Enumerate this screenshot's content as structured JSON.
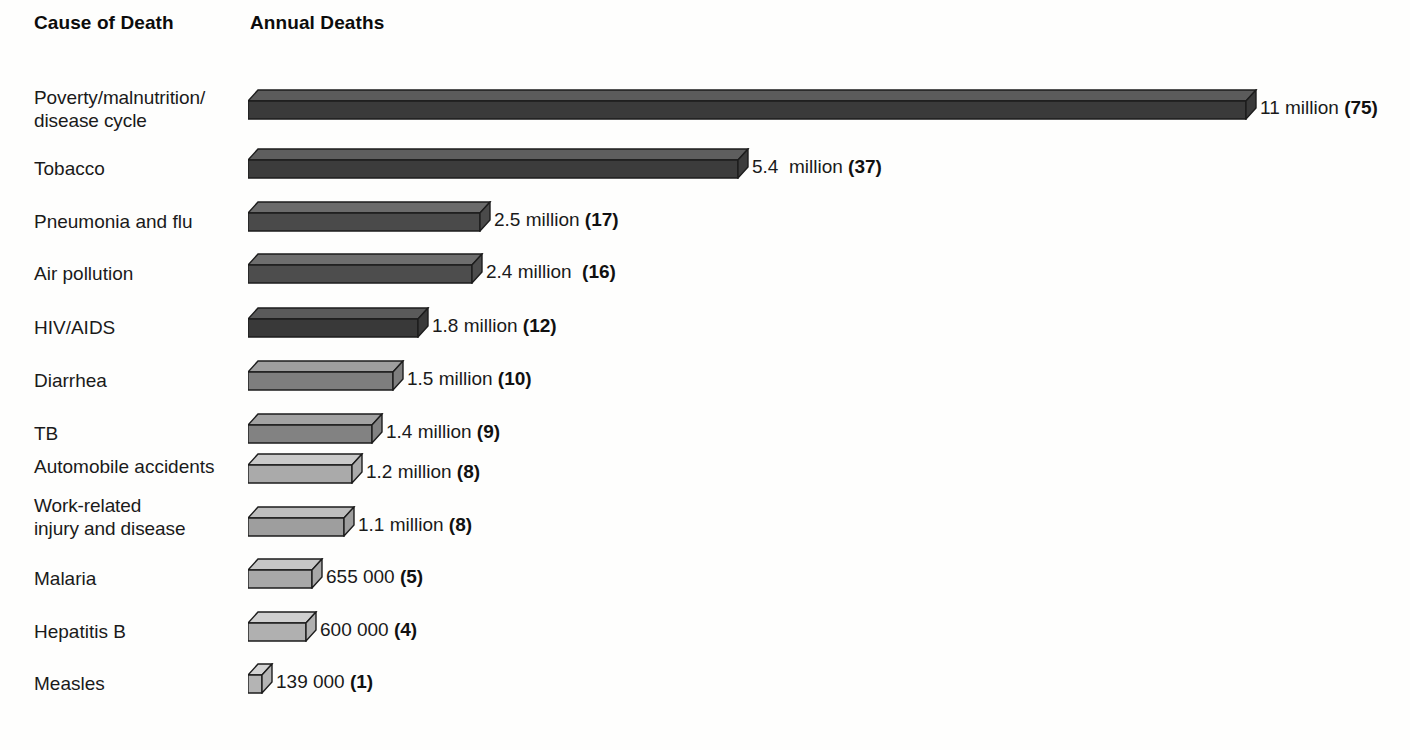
{
  "header": {
    "cause_label": "Cause of Death",
    "deaths_label": "Annual Deaths"
  },
  "chart_data": {
    "type": "bar",
    "orientation": "horizontal",
    "title": "",
    "subtitle": "",
    "xlabel": "Annual Deaths",
    "ylabel": "Cause of Death",
    "grid": false,
    "legend": null,
    "note": "Values in parentheses are the number of deaths per 1000 total, i.e. relative share indices shown bold next to each bar.",
    "categories": [
      "Poverty/malnutrition/\ndisease cycle",
      "Tobacco",
      "Pneumonia and flu",
      "Air pollution",
      "HIV/AIDS",
      "Diarrhea",
      "TB",
      "Automobile accidents",
      "Work-related\ninjury and disease",
      "Malaria",
      "Hepatitis B",
      "Measles"
    ],
    "values": [
      11000000,
      5400000,
      2500000,
      2400000,
      1800000,
      1500000,
      1400000,
      1200000,
      1100000,
      655000,
      600000,
      139000
    ],
    "value_text": [
      "11 million ",
      "5.4  million ",
      "2.5 million ",
      "2.4 million  ",
      "1.8 million ",
      "1.5 million ",
      "1.4 million ",
      "1.2 million ",
      "1.1 million ",
      "655 000 ",
      "600 000 ",
      "139 000 "
    ],
    "paren_text": [
      "(75)",
      "(37)",
      "(17)",
      "(16)",
      "(12)",
      "(10)",
      "(9)",
      "(8)",
      "(8)",
      "(5)",
      "(4)",
      "(1)"
    ],
    "paren_values": [
      75,
      37,
      17,
      16,
      12,
      10,
      9,
      8,
      8,
      5,
      4,
      1
    ],
    "xlim": [
      0,
      11000000
    ],
    "bar_colors_top": [
      "#5b5b5b",
      "#5e5e5e",
      "#6b6b6b",
      "#6e6e6e",
      "#5a5a5a",
      "#9e9e9e",
      "#a2a2a2",
      "#c9c9c9",
      "#bdbdbd",
      "#c6c6c6",
      "#cfcfcf",
      "#d3d3d3"
    ],
    "bar_colors_front": [
      "#3a3a3a",
      "#3c3c3c",
      "#4a4a4a",
      "#4d4d4d",
      "#393939",
      "#7e7e7e",
      "#828282",
      "#aaaaaa",
      "#9e9e9e",
      "#a8a8a8",
      "#b0b0b0",
      "#b4b4b4"
    ]
  },
  "rows": [
    {
      "label": "Poverty/malnutrition/\ndisease cycle",
      "label_top": 86,
      "label_lines": 2,
      "value": "11 million ",
      "paren": "(75)",
      "bar_len": 998,
      "bar_top": 89,
      "row_top": 83
    },
    {
      "label": "Tobacco",
      "label_top": 157,
      "label_lines": 1,
      "value": "5.4  million ",
      "paren": "(37)",
      "bar_len": 490,
      "bar_top": 148,
      "row_top": 142
    },
    {
      "label": "Pneumonia and flu",
      "label_top": 210,
      "label_lines": 1,
      "value": "2.5 million ",
      "paren": "(17)",
      "bar_len": 232,
      "bar_top": 201,
      "row_top": 195
    },
    {
      "label": "Air pollution",
      "label_top": 262,
      "label_lines": 1,
      "value": "2.4 million  ",
      "paren": "(16)",
      "bar_len": 224,
      "bar_top": 253,
      "row_top": 247
    },
    {
      "label": "HIV/AIDS",
      "label_top": 316,
      "label_lines": 1,
      "value": "1.8 million ",
      "paren": "(12)",
      "bar_len": 170,
      "bar_top": 307,
      "row_top": 301
    },
    {
      "label": "Diarrhea",
      "label_top": 369,
      "label_lines": 1,
      "value": "1.5 million ",
      "paren": "(10)",
      "bar_len": 145,
      "bar_top": 360,
      "row_top": 354
    },
    {
      "label": "TB",
      "label_top": 422,
      "label_lines": 1,
      "value": "1.4 million ",
      "paren": "(9)",
      "bar_len": 124,
      "bar_top": 413,
      "row_top": 407
    },
    {
      "label": "Automobile accidents",
      "label_top": 455,
      "label_lines": 1,
      "value": "1.2 million ",
      "paren": "(8)",
      "bar_len": 104,
      "bar_top": 453,
      "row_top": 447
    },
    {
      "label": "Work-related\ninjury and disease",
      "label_top": 494,
      "label_lines": 2,
      "value": "1.1 million ",
      "paren": "(8)",
      "bar_len": 96,
      "bar_top": 506,
      "row_top": 500
    },
    {
      "label": "Malaria",
      "label_top": 567,
      "label_lines": 1,
      "value": "655 000 ",
      "paren": "(5)",
      "bar_len": 64,
      "bar_top": 558,
      "row_top": 552
    },
    {
      "label": "Hepatitis B",
      "label_top": 620,
      "label_lines": 1,
      "value": "600 000 ",
      "paren": "(4)",
      "bar_len": 58,
      "bar_top": 611,
      "row_top": 605
    },
    {
      "label": "Measles",
      "label_top": 672,
      "label_lines": 1,
      "value": "139 000 ",
      "paren": "(1)",
      "bar_len": 14,
      "bar_top": 663,
      "row_top": 657
    }
  ]
}
